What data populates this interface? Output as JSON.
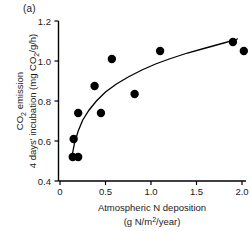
{
  "figure": {
    "panel_label": "(a)",
    "background_color": "#ffffff",
    "point_color": "#000000",
    "curve_color": "#000000"
  },
  "chart_data": {
    "type": "scatter",
    "title": "",
    "panel_label": "(a)",
    "xlabel_line1": "Atmospheric N deposition",
    "xlabel_line2_pre": "(g N/m",
    "xlabel_line2_sup": "2",
    "xlabel_line2_post": "/year)",
    "xlabel_full": "Atmospheric N deposition (g N/m2/year)",
    "ylabel_line1_pre": "CO",
    "ylabel_line1_sub": "2",
    "ylabel_line1_post": " emission",
    "ylabel_line2_pre": "4 days' incubation (mg CO",
    "ylabel_line2_sub": "2",
    "ylabel_line2_post": "/g/h)",
    "ylabel_full": "CO2 emission 4 days' incubation (mg CO2/g/h)",
    "xlim": [
      0,
      2.1
    ],
    "ylim": [
      0.4,
      1.2
    ],
    "xticks": [
      0,
      0.5,
      1.0,
      1.5,
      2.0
    ],
    "xticklabels": [
      "0",
      "0.5",
      "1.0",
      "1.5",
      "2.0"
    ],
    "yticks": [
      0.4,
      0.6,
      0.8,
      1.0,
      1.2
    ],
    "yticklabels": [
      "0.4",
      "0.6",
      "0.8",
      "1.0",
      "1.2"
    ],
    "grid": false,
    "legend": false,
    "marker": "filled-circle",
    "points": [
      {
        "x": 0.14,
        "y": 0.52
      },
      {
        "x": 0.2,
        "y": 0.52
      },
      {
        "x": 0.15,
        "y": 0.61
      },
      {
        "x": 0.2,
        "y": 0.74
      },
      {
        "x": 0.38,
        "y": 0.875
      },
      {
        "x": 0.45,
        "y": 0.74
      },
      {
        "x": 0.57,
        "y": 1.01
      },
      {
        "x": 0.82,
        "y": 0.835
      },
      {
        "x": 1.1,
        "y": 1.05
      },
      {
        "x": 1.9,
        "y": 1.095
      },
      {
        "x": 2.02,
        "y": 1.05
      }
    ],
    "fit_curve": {
      "label": "saturating fit",
      "x": [
        0.13,
        0.16,
        0.2,
        0.25,
        0.32,
        0.4,
        0.5,
        0.62,
        0.75,
        0.9,
        1.05,
        1.2,
        1.4,
        1.6,
        1.8,
        1.95
      ],
      "y": [
        0.52,
        0.59,
        0.65,
        0.705,
        0.755,
        0.8,
        0.845,
        0.885,
        0.92,
        0.955,
        0.985,
        1.01,
        1.04,
        1.065,
        1.09,
        1.11
      ]
    }
  }
}
